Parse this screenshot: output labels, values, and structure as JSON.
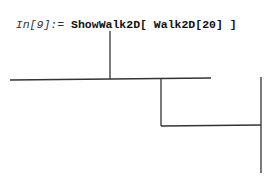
{
  "cell": {
    "prompt": "In[9]:= ",
    "input": "ShowWalk2D[ Walk2D[20] ]"
  },
  "plot": {
    "type": "random-walk-2d",
    "stroke_color": "#333333",
    "segments": [
      {
        "x1": 110,
        "y1": 31,
        "x2": 110,
        "y2": 79
      },
      {
        "x1": 10,
        "y1": 80,
        "x2": 110,
        "y2": 79
      },
      {
        "x1": 110,
        "y1": 79,
        "x2": 211,
        "y2": 78
      },
      {
        "x1": 161,
        "y1": 78,
        "x2": 161,
        "y2": 126
      },
      {
        "x1": 161,
        "y1": 126,
        "x2": 261,
        "y2": 125
      },
      {
        "x1": 261,
        "y1": 77,
        "x2": 261,
        "y2": 173
      }
    ]
  }
}
